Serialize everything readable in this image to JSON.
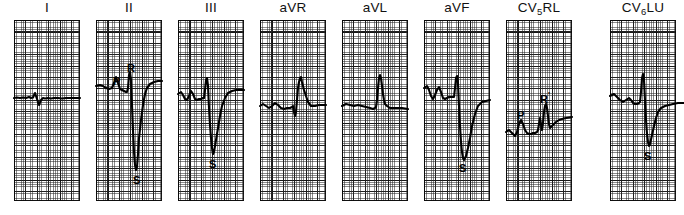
{
  "figure": {
    "type": "ecg-12-lead-strip",
    "panel_count": 8,
    "grid": {
      "small_box_px": 2.28,
      "large_box_px": 11.4,
      "fine_color": "#282828",
      "bold_color": "#0a0a0a",
      "paper_color": "#ffffff"
    },
    "trace_color": "#000000",
    "panel_width_px": 66,
    "panel_height_px": 181,
    "panel_pitch_px": 82
  },
  "panels": [
    {
      "id": "lead-i",
      "label": "I",
      "label_sub": "",
      "label_tail": "",
      "x": 14,
      "trace": "M0,78 L3,77.5 L6,78 L9,77.5 L12,78 L15,77 L17,78 L19,77.5 L21,73 L23,79 L25,85 L27,80 L29,78 L31,78.5 L34,78 L37,78.5 L40,78 L44,78 L48,78.5 L52,78 L56,78 L60,78 L66,78",
      "wave_labels": []
    },
    {
      "id": "lead-ii",
      "label": "II",
      "label_sub": "",
      "label_tail": "",
      "x": 96,
      "trace": "M0,66 L4,65 L7,66 L10,68 L13,69 L16,68 L18,63 L20,57 L22,63 L24,69 L26,70 L28,71 L30,72 L31,72 L32,68 L33,55 L34,52 L35,60 L36,85 L37,110 L38,132 L39,145 L40,150 L41,147 L42,134 L43,118 L45,100 L47,85 L49,74 L51,68 L54,64 L58,62 L62,61 L66,61",
      "wave_labels": [
        {
          "text": "P",
          "prime": false,
          "x": 17,
          "y": 56
        },
        {
          "text": "R",
          "prime": false,
          "x": 31,
          "y": 43
        },
        {
          "text": "S",
          "prime": false,
          "x": 37,
          "y": 155
        }
      ]
    },
    {
      "id": "lead-iii",
      "label": "III",
      "label_sub": "",
      "label_tail": "",
      "x": 178,
      "trace": "M0,74 L3,72 L5,75 L7,79 L9,80 L11,76 L13,71 L15,74 L17,79 L19,80 L21,79 L23,79 L25,78 L26,78 L27,70 L28,60 L29,58 L30,66 L31,88 L32,105 L33,118 L34,128 L35,134 L36,132 L38,120 L40,108 L42,96 L44,86 L47,78 L50,73 L54,71 L58,70 L62,70 L66,70",
      "wave_labels": [
        {
          "text": "S",
          "prime": false,
          "x": 31,
          "y": 139
        }
      ]
    },
    {
      "id": "lead-avr",
      "label": "aVR",
      "label_sub": "",
      "label_tail": "",
      "x": 260,
      "trace": "M0,86 L3,84 L6,86 L9,88 L12,86 L15,83 L18,85 L21,88 L24,89 L27,88 L30,88 L32,87 L33,86 L34,92 L35,96 L36,92 L37,80 L38,68 L39,62 L40,58 L41,57 L42,62 L44,70 L46,76 L48,82 L51,86 L55,86 L59,85 L62,85 L66,85",
      "wave_labels": []
    },
    {
      "id": "lead-avl",
      "label": "aVL",
      "label_sub": "",
      "label_tail": "",
      "x": 342,
      "trace": "M0,86 L4,84 L8,85 L12,86 L16,85 L20,86 L24,87 L28,88 L31,89 L33,88 L34,87 L35,80 L36,68 L37,58 L38,55 L39,58 L40,66 L41,74 L42,80 L43,84 L45,86 L48,88 L52,88 L56,88 L60,88 L66,89",
      "wave_labels": []
    },
    {
      "id": "lead-avf",
      "label": "aVF",
      "label_sub": "",
      "label_tail": "",
      "x": 424,
      "trace": "M0,68 L3,66 L5,70 L7,76 L9,79 L11,75 L13,70 L15,67 L17,72 L19,78 L21,79 L23,78 L25,77 L27,77 L29,77 L30,77 L31,68 L32,58 L33,56 L34,64 L35,86 L36,106 L37,122 L38,132 L39,138 L40,140 L42,136 L44,128 L46,118 L48,106 L51,94 L54,86 L58,82 L62,81 L66,80",
      "wave_labels": [
        {
          "text": "S",
          "prime": false,
          "x": 35,
          "y": 143
        }
      ]
    },
    {
      "id": "lead-cv5rl",
      "label": "CV",
      "label_sub": "5",
      "label_tail": "RL",
      "x": 506,
      "trace": "M0,112 L3,110 L6,113 L9,116 L11,112 L13,104 L15,100 L17,104 L19,110 L21,113 L23,114 L25,114 L27,113 L29,113 L31,112 L32,110 L33,104 L34,98 L35,104 L36,110 L37,103 L38,92 L39,86 L40,84 L41,88 L42,96 L43,104 L44,108 L46,106 L48,104 L50,102 L53,100 L56,99 L60,98 L66,97",
      "wave_labels": [
        {
          "text": "P",
          "prime": false,
          "x": 11,
          "y": 90
        },
        {
          "text": "R",
          "prime": true,
          "x": 34,
          "y": 70
        }
      ]
    },
    {
      "id": "lead-cv6lu",
      "label": "CV",
      "label_sub": "6",
      "label_tail": "LU",
      "x": 610,
      "trace": "M0,76 L4,74 L7,77 L10,80 L13,82 L16,80 L19,78 L21,80 L23,83 L25,84 L27,84 L29,83 L30,82 L31,72 L32,58 L33,54 L34,60 L35,80 L36,100 L37,114 L38,122 L39,126 L40,124 L42,115 L44,106 L46,98 L48,92 L51,88 L55,86 L59,85 L63,84 L68,83 L74,83",
      "wave_labels": [
        {
          "text": "S",
          "prime": false,
          "x": 34,
          "y": 131
        }
      ]
    }
  ]
}
